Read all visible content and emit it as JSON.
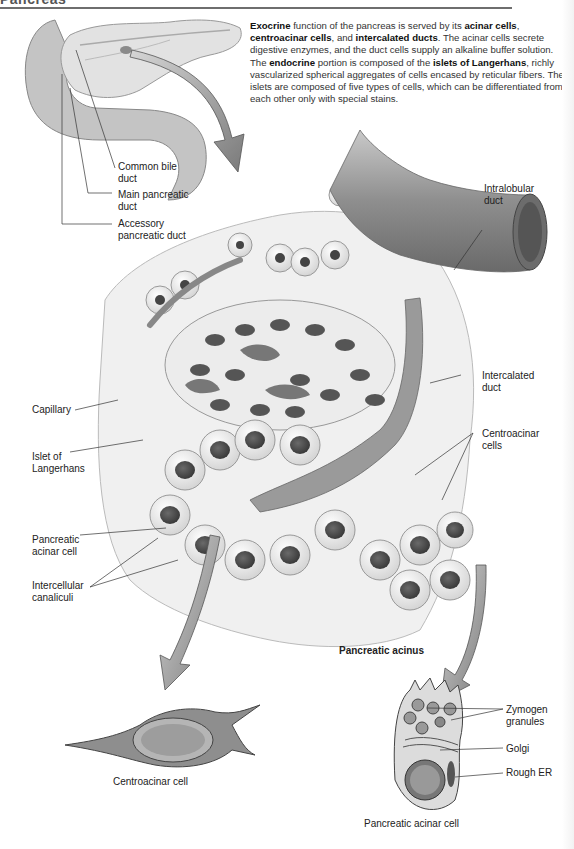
{
  "header": {
    "title": "Pancreas"
  },
  "intro": {
    "paragraph1": [
      {
        "text": "Exocrine",
        "bold": true
      },
      {
        "text": " function of the pancreas is served by its ",
        "bold": false
      },
      {
        "text": "acinar cells",
        "bold": true
      },
      {
        "text": ", ",
        "bold": false
      },
      {
        "text": "centroacinar cells",
        "bold": true
      },
      {
        "text": ", and ",
        "bold": false
      },
      {
        "text": "intercalated ducts",
        "bold": true
      },
      {
        "text": ". The acinar cells secrete digestive enzymes, and the duct cells supply an alkaline buffer solution.",
        "bold": false
      }
    ],
    "paragraph2": [
      {
        "text": "The ",
        "bold": false
      },
      {
        "text": "endocrine",
        "bold": true
      },
      {
        "text": " portion is composed of the ",
        "bold": false
      },
      {
        "text": "islets of Langerhans",
        "bold": true
      },
      {
        "text": ", richly vascularized spherical aggregates of cells encased by reticular fibers. The islets are composed of five types of cells, which can be differentiated from each other only with special stains.",
        "bold": false
      }
    ]
  },
  "labels": {
    "common_bile_duct": [
      "Common bile",
      "duct"
    ],
    "main_pancreatic_duct": [
      "Main pancreatic",
      "duct"
    ],
    "accessory_pancreatic_duct": [
      "Accessory",
      "pancreatic duct"
    ],
    "intralobular_duct": [
      "Intralobular",
      "duct"
    ],
    "intercalated_duct": [
      "Intercalated",
      "duct"
    ],
    "capillary": [
      "Capillary"
    ],
    "islet_of_langerhans": [
      "Islet of",
      "Langerhans"
    ],
    "centroacinar_cells": [
      "Centroacinar",
      "cells"
    ],
    "pancreatic_acinar_cell": [
      "Pancreatic",
      "acinar cell"
    ],
    "intercellular_canaliculi": [
      "Intercellular",
      "canaliculi"
    ],
    "pancreatic_acinus": [
      "Pancreatic acinus"
    ],
    "centroacinar_cell_caption": [
      "Centroacinar cell"
    ],
    "zymogen_granules": [
      "Zymogen",
      "granules"
    ],
    "golgi": [
      "Golgi"
    ],
    "rough_er": [
      "Rough ER"
    ],
    "pancreatic_acinar_cell_caption": [
      "Pancreatic acinar cell"
    ]
  },
  "colors": {
    "rule": "#6e6e6e",
    "arrow": "#8a8a8a",
    "tissue_light": "#e8e8e8",
    "tissue_mid": "#a9a9a9",
    "nucleus": "#4a4a4a",
    "leader_line": "#333333"
  }
}
